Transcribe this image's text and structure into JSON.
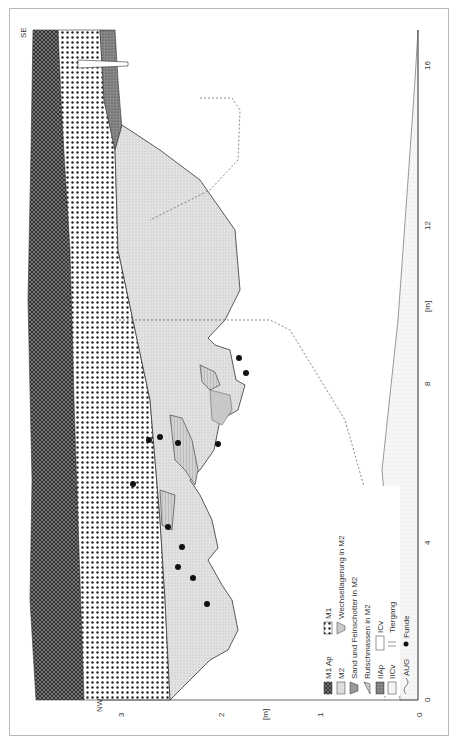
{
  "figure": {
    "orientation": "rotated-90-ccw",
    "orientation_labels": {
      "left_end": "NW",
      "right_end": "SE"
    },
    "x_axis": {
      "unit": "[m]",
      "ticks": [
        "0",
        "4",
        "8",
        "12",
        "16"
      ]
    },
    "y_axis": {
      "unit": "[m]",
      "ticks": [
        "0",
        "1",
        "2",
        "3"
      ]
    },
    "colors": {
      "frame": "#b9b9b9",
      "line": "#444444",
      "fill_m2": "#dcdcdc",
      "fill_dark": "#555555",
      "find": "#111111"
    }
  },
  "legend": {
    "items": [
      {
        "label": "M1 Ap",
        "icon": "crosshatch-dark-swatch"
      },
      {
        "label": "M1",
        "icon": "dotted-swatch"
      },
      {
        "label": "M2",
        "icon": "fine-stipple-swatch"
      },
      {
        "label": "Wechsellagerung in M2",
        "icon": "bowl-lenses-icon"
      },
      {
        "label": "Sand und Feinschotter in M2",
        "icon": "stacked-lens-icon"
      },
      {
        "label": "Rutschmassen in M2",
        "icon": "slump-mass-icon"
      },
      {
        "label": "IIAp",
        "icon": "dense-stipple-swatch"
      },
      {
        "label": "ICv",
        "icon": "outline-box-swatch"
      },
      {
        "label": "IICv",
        "icon": "blank-box-swatch"
      },
      {
        "label": "Tiergang",
        "icon": "burrow-icon"
      },
      {
        "label": "AUG",
        "icon": "wavy-line-icon"
      },
      {
        "label": "Funde",
        "icon": "filled-dot-icon"
      }
    ]
  },
  "finds_count": 15
}
